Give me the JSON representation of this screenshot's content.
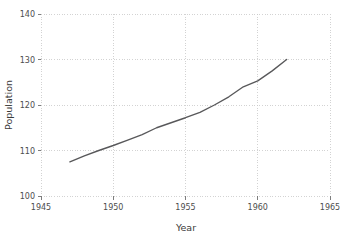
{
  "chart_data": {
    "type": "line",
    "title": "",
    "xlabel": "Year",
    "ylabel": "Population",
    "xlim": [
      1945,
      1965
    ],
    "ylim": [
      100,
      140
    ],
    "xticks": [
      1945,
      1950,
      1955,
      1960,
      1965
    ],
    "yticks": [
      100,
      110,
      120,
      130,
      140
    ],
    "grid": true,
    "legend": null,
    "series": [
      {
        "name": "Population",
        "x": [
          1947,
          1948,
          1949,
          1950,
          1951,
          1952,
          1953,
          1954,
          1955,
          1956,
          1957,
          1958,
          1959,
          1960,
          1961,
          1962
        ],
        "values": [
          107.5,
          108.8,
          110.0,
          111.1,
          112.3,
          113.5,
          115.0,
          116.1,
          117.2,
          118.4,
          120.0,
          121.8,
          124.0,
          125.3,
          127.5,
          130.0
        ]
      }
    ]
  },
  "axes": {
    "x_label": "Year",
    "y_label": "Population",
    "x_tick_labels": [
      "1945",
      "1950",
      "1955",
      "1960",
      "1965"
    ],
    "y_tick_labels": [
      "100",
      "110",
      "120",
      "130",
      "140"
    ]
  },
  "colors": {
    "line": "#58585a",
    "grid": "#c8c8c8",
    "tick_text": "#4d4d4d",
    "axis_title": "#3a3a3a",
    "background": "#ffffff"
  }
}
